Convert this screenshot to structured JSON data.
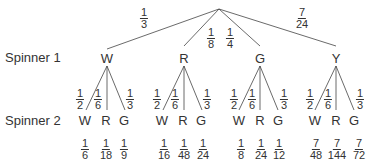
{
  "labels": {
    "spinner1": "Spinner 1",
    "spinner2": "Spinner 2"
  },
  "level1": [
    {
      "outcome": "W",
      "prob": {
        "n": "1",
        "d": "3"
      }
    },
    {
      "outcome": "R",
      "prob": {
        "n": "1",
        "d": "8"
      }
    },
    {
      "outcome": "G",
      "prob": {
        "n": "1",
        "d": "4"
      }
    },
    {
      "outcome": "Y",
      "prob": {
        "n": "7",
        "d": "24"
      }
    }
  ],
  "level2_branches": [
    {
      "outcome": "W",
      "prob": {
        "n": "1",
        "d": "2"
      }
    },
    {
      "outcome": "R",
      "prob": {
        "n": "1",
        "d": "6"
      }
    },
    {
      "outcome": "G",
      "prob": {
        "n": "1",
        "d": "3"
      }
    }
  ],
  "results": [
    [
      {
        "n": "1",
        "d": "6"
      },
      {
        "n": "1",
        "d": "18"
      },
      {
        "n": "1",
        "d": "9"
      }
    ],
    [
      {
        "n": "1",
        "d": "16"
      },
      {
        "n": "1",
        "d": "48"
      },
      {
        "n": "1",
        "d": "24"
      }
    ],
    [
      {
        "n": "1",
        "d": "8"
      },
      {
        "n": "1",
        "d": "24"
      },
      {
        "n": "1",
        "d": "12"
      }
    ],
    [
      {
        "n": "7",
        "d": "48"
      },
      {
        "n": "7",
        "d": "144"
      },
      {
        "n": "7",
        "d": "72"
      }
    ]
  ]
}
